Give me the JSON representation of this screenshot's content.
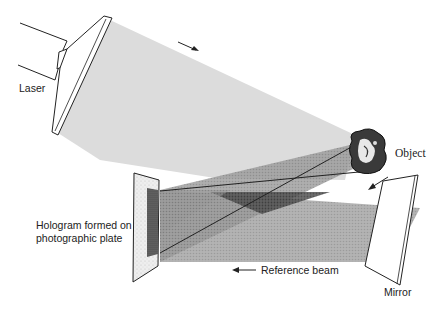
{
  "diagram": {
    "labels": {
      "laser": "Laser",
      "object": "Object",
      "hologram_line1": "Hologram formed on",
      "hologram_line2": "photographic plate",
      "reference_beam": "Reference beam",
      "mirror": "Mirror"
    },
    "arrows": {
      "laser_beam_direction": "down-right",
      "object_to_mirror": "down-left",
      "reference_beam_direction": "left"
    },
    "colors": {
      "laser_beam": "#dcdcdc",
      "object_beam": "#a8a8a8",
      "reference_beam": "#b4b4b4",
      "overlap": "#6e6e6e",
      "plate": "#f2f2f2",
      "plate_image": "#5a5a5a",
      "outline": "#1a1a1a"
    }
  }
}
